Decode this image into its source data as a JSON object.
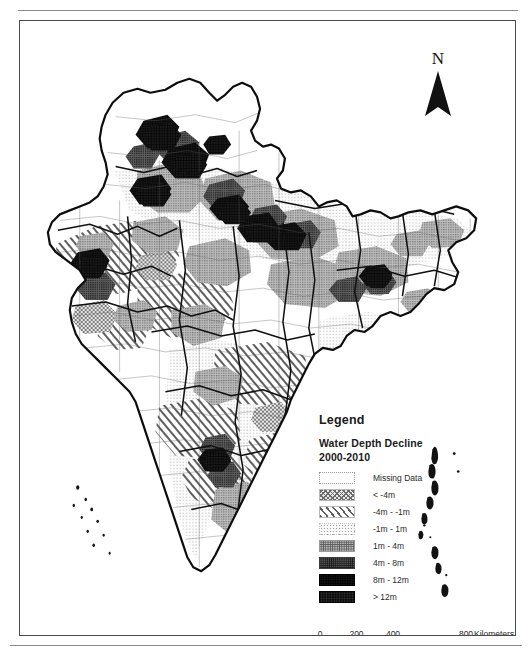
{
  "figure": {
    "kind": "thematic-choropleth-map",
    "region": "India"
  },
  "north_arrow": {
    "label": "N",
    "icon": "north-arrow-icon"
  },
  "legend": {
    "title": "Legend",
    "subtitle_line1": "Water Depth Decline",
    "subtitle_line2": "2000-2010",
    "items": [
      {
        "label": "Missing Data",
        "swatch_class": "sw-missing",
        "swatch_name": "swatch-missing-data"
      },
      {
        "label": "< -4m",
        "swatch_class": "sw-lt-neg4",
        "swatch_name": "swatch-lt-neg4m"
      },
      {
        "label": "-4m - -1m",
        "swatch_class": "sw-neg4-neg1",
        "swatch_name": "swatch-neg4m-neg1m"
      },
      {
        "label": "-1m - 1m",
        "swatch_class": "sw-neg1-1",
        "swatch_name": "swatch-neg1m-1m"
      },
      {
        "label": "1m - 4m",
        "swatch_class": "sw-1-4",
        "swatch_name": "swatch-1m-4m"
      },
      {
        "label": "4m - 8m",
        "swatch_class": "sw-4-8",
        "swatch_name": "swatch-4m-8m"
      },
      {
        "label": "8m - 12m",
        "swatch_class": "sw-8-12",
        "swatch_name": "swatch-8m-12m"
      },
      {
        "label": "> 12m",
        "swatch_class": "sw-gt12",
        "swatch_name": "swatch-gt-12m"
      }
    ]
  },
  "scale_bar": {
    "ticks": [
      {
        "label": "0",
        "pos_pct": 0
      },
      {
        "label": "200",
        "pos_pct": 25
      },
      {
        "label": "400",
        "pos_pct": 50
      },
      {
        "label": "800",
        "pos_pct": 100
      }
    ],
    "unit_label": "Kilometers"
  },
  "chart_data": {
    "type": "map",
    "title": "Water Depth Decline 2000-2010",
    "subtitle": "India — district level groundwater depth change",
    "classification": "choropleth, 7 classes plus missing-data",
    "legend_position": "lower-right inside neatline",
    "categories": [
      "Missing Data",
      "< -4m",
      "-4m - -1m",
      "-1m - 1m",
      "1m - 4m",
      "4m - 8m",
      "8m - 12m",
      "> 12m"
    ],
    "class_breaks_m": [
      -4,
      -1,
      1,
      4,
      8,
      12
    ],
    "scale_units": "Kilometers",
    "scale_ticks": [
      0,
      200,
      400,
      800
    ],
    "grid": false
  }
}
